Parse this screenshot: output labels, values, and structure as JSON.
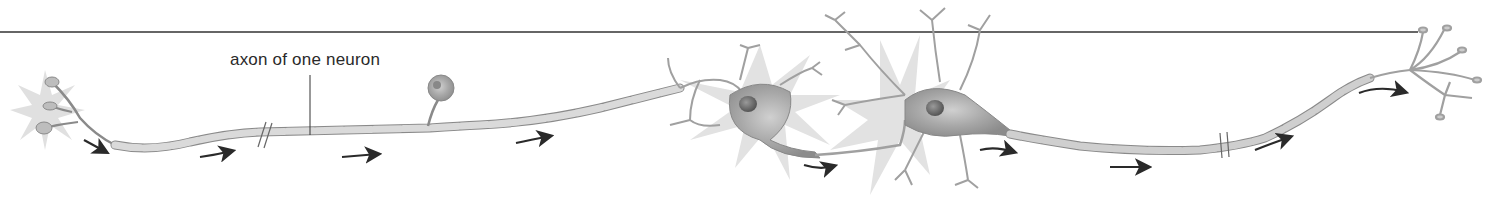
{
  "diagram": {
    "title": "",
    "labels": [
      {
        "id": "axon-label",
        "text": "axon of one neuron",
        "x": 230,
        "y": 50
      }
    ],
    "components": [
      "sensory-receptor-endings",
      "myelinated-axon-segment-1",
      "cell-body-sensory",
      "myelinated-axon-segment-2",
      "interneuron-cell-body-1",
      "interneuron-cell-body-2",
      "myelinated-axon-segment-3",
      "axon-terminals"
    ],
    "arrows_count": 9,
    "colors": {
      "line": "#333333",
      "axon_fill": "#d9d9d9",
      "axon_stroke": "#8a8a8a",
      "soma_fill": "#a9a9a9",
      "nucleus": "#6e6e6e",
      "burst": "#dcdcdc",
      "arrow": "#2a2a2a"
    }
  }
}
